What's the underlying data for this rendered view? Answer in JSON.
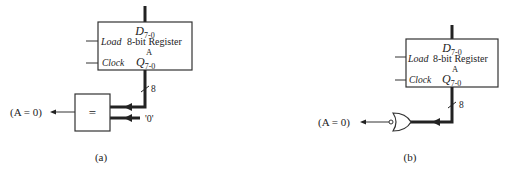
{
  "figure_a": {
    "caption": "(a)",
    "register": {
      "input_label": "D",
      "input_sub": "7-0",
      "name_line1": "8-bit Register",
      "name_line2": "A",
      "output_label": "Q",
      "output_sub": "7-0",
      "load_label": "Load",
      "clock_label": "Clock"
    },
    "bus_width": "8",
    "comparator_symbol": "=",
    "constant_input": "'0'",
    "output_label": "(A = 0)"
  },
  "figure_b": {
    "caption": "(b)",
    "register": {
      "input_label": "D",
      "input_sub": "7-0",
      "name_line1": "8-bit Register",
      "name_line2": "A",
      "output_label": "Q",
      "output_sub": "7-0",
      "load_label": "Load",
      "clock_label": "Clock"
    },
    "bus_width": "8",
    "gate": "NOR",
    "output_label": "(A = 0)"
  }
}
